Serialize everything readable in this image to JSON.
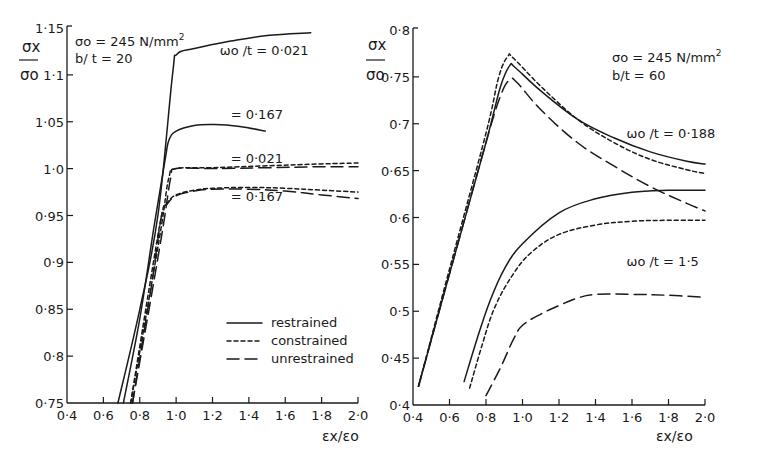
{
  "chart_data": [
    {
      "type": "line",
      "panel": "left",
      "title": "",
      "annotation": [
        "σo = 245 N/mm²",
        "b/ t = 20"
      ],
      "xlabel": "εx/εo",
      "ylabel": "σx/σo",
      "xlim": [
        0.4,
        2.0
      ],
      "ylim": [
        0.75,
        1.15
      ],
      "xticks": [
        "0·4",
        "0·6",
        "0·8",
        "1·0",
        "1·2",
        "1·4",
        "1·6",
        "1·8",
        "2·0"
      ],
      "yticks": [
        "0·75",
        "0·8",
        "0·85",
        "0·9",
        "0·95",
        "1·0",
        "1·05",
        "1·1",
        "1·15"
      ],
      "grid": false,
      "legend": {
        "position": "lower right",
        "entries": [
          {
            "style": "solid",
            "label": "restrained"
          },
          {
            "style": "short-dash",
            "label": "constrained"
          },
          {
            "style": "long-dash",
            "label": "unrestrained"
          }
        ]
      },
      "curve_labels": [
        {
          "text": "ωo /t = 0·021",
          "x": 1.24,
          "y": 1.121
        },
        {
          "text": "= 0·167",
          "x": 1.3,
          "y": 1.053
        },
        {
          "text": "= 0·021",
          "x": 1.3,
          "y": 1.006
        },
        {
          "text": "= 0·167",
          "x": 1.3,
          "y": 0.966
        }
      ],
      "series": [
        {
          "name": "restrained ωo/t=0.021",
          "style": "restrained",
          "x": [
            0.68,
            0.8,
            0.9,
            0.98,
            1.005,
            1.1,
            1.3,
            1.5,
            1.74
          ],
          "y": [
            0.75,
            0.85,
            0.95,
            1.1,
            1.122,
            1.128,
            1.136,
            1.142,
            1.145
          ]
        },
        {
          "name": "restrained ωo/t=0.167",
          "style": "restrained",
          "x": [
            0.71,
            0.8,
            0.88,
            0.94,
            0.96,
            1.0,
            1.1,
            1.21,
            1.35,
            1.49
          ],
          "y": [
            0.75,
            0.84,
            0.94,
            1.01,
            1.03,
            1.04,
            1.046,
            1.047,
            1.045,
            1.04
          ]
        },
        {
          "name": "constrained ωo/t=0.021",
          "style": "constrained",
          "x": [
            0.75,
            0.85,
            0.92,
            0.96,
            1.0,
            1.2,
            1.5,
            1.8,
            2.0
          ],
          "y": [
            0.75,
            0.86,
            0.94,
            0.99,
            1.0,
            1.001,
            1.003,
            1.005,
            1.006
          ]
        },
        {
          "name": "unrestrained ωo/t=0.021",
          "style": "unrestrained",
          "x": [
            0.76,
            0.86,
            0.93,
            0.97,
            1.0,
            1.2,
            1.5,
            1.8,
            2.0
          ],
          "y": [
            0.75,
            0.86,
            0.94,
            0.99,
            1.0,
            1.0,
            1.001,
            1.002,
            1.002
          ]
        },
        {
          "name": "constrained ωo/t=0.167",
          "style": "constrained",
          "x": [
            0.75,
            0.85,
            0.92,
            0.95,
            1.0,
            1.1,
            1.2,
            1.4,
            1.6,
            1.8,
            2.0
          ],
          "y": [
            0.75,
            0.87,
            0.95,
            0.963,
            0.972,
            0.977,
            0.979,
            0.98,
            0.979,
            0.977,
            0.975
          ]
        },
        {
          "name": "unrestrained ωo/t=0.167",
          "style": "unrestrained",
          "x": [
            0.76,
            0.86,
            0.92,
            0.95,
            1.0,
            1.1,
            1.2,
            1.4,
            1.6,
            1.8,
            2.0
          ],
          "y": [
            0.75,
            0.87,
            0.95,
            0.962,
            0.971,
            0.976,
            0.978,
            0.978,
            0.976,
            0.972,
            0.968
          ]
        }
      ]
    },
    {
      "type": "line",
      "panel": "right",
      "title": "",
      "annotation": [
        "σo = 245 N/mm²",
        "b/t = 60"
      ],
      "xlabel": "εx/εo",
      "ylabel": "σx/σo",
      "xlim": [
        0.4,
        2.0
      ],
      "ylim": [
        0.4,
        0.8
      ],
      "xticks": [
        "0·4",
        "0·6",
        "0·8",
        "1·0",
        "1·2",
        "1·4",
        "1·6",
        "1·8",
        "2·0"
      ],
      "yticks": [
        "0·4",
        "0·45",
        "0·5",
        "0·55",
        "0·6",
        "0·65",
        "0·7",
        "0·75",
        "0·8"
      ],
      "grid": false,
      "curve_labels": [
        {
          "text": "ωo /t = 0·188",
          "x": 1.57,
          "y": 0.685
        },
        {
          "text": "ωo /t = 1·5",
          "x": 1.57,
          "y": 0.548
        }
      ],
      "series": [
        {
          "name": "restrained ωo/t=0.188",
          "style": "restrained",
          "x": [
            0.43,
            0.6,
            0.8,
            0.88,
            0.93,
            0.96,
            1.1,
            1.3,
            1.5,
            1.7,
            1.9,
            2.0
          ],
          "y": [
            0.42,
            0.54,
            0.68,
            0.74,
            0.762,
            0.76,
            0.735,
            0.705,
            0.685,
            0.67,
            0.66,
            0.657
          ]
        },
        {
          "name": "constrained ωo/t=0.188",
          "style": "constrained",
          "x": [
            0.43,
            0.6,
            0.8,
            0.87,
            0.92,
            0.95,
            1.1,
            1.3,
            1.5,
            1.7,
            1.9,
            2.0
          ],
          "y": [
            0.42,
            0.545,
            0.69,
            0.75,
            0.772,
            0.77,
            0.74,
            0.705,
            0.68,
            0.662,
            0.651,
            0.647
          ]
        },
        {
          "name": "unrestrained ωo/t=0.188",
          "style": "unrestrained",
          "x": [
            0.43,
            0.6,
            0.8,
            0.88,
            0.93,
            0.97,
            1.1,
            1.3,
            1.5,
            1.7,
            1.9,
            2.0
          ],
          "y": [
            0.42,
            0.54,
            0.68,
            0.73,
            0.747,
            0.744,
            0.715,
            0.68,
            0.655,
            0.633,
            0.615,
            0.607
          ]
        },
        {
          "name": "restrained ωo/t=1.5",
          "style": "restrained",
          "x": [
            0.68,
            0.75,
            0.82,
            0.9,
            1.0,
            1.2,
            1.4,
            1.6,
            1.8,
            2.0
          ],
          "y": [
            0.425,
            0.47,
            0.51,
            0.545,
            0.572,
            0.605,
            0.62,
            0.627,
            0.629,
            0.629
          ]
        },
        {
          "name": "constrained ωo/t=1.5",
          "style": "constrained",
          "x": [
            0.71,
            0.78,
            0.85,
            0.95,
            1.05,
            1.2,
            1.4,
            1.6,
            1.8,
            2.0
          ],
          "y": [
            0.418,
            0.465,
            0.505,
            0.54,
            0.563,
            0.582,
            0.592,
            0.596,
            0.597,
            0.597
          ]
        },
        {
          "name": "unrestrained ωo/t=1.5",
          "style": "unrestrained",
          "x": [
            0.8,
            0.88,
            0.95,
            1.0,
            1.1,
            1.2,
            1.3,
            1.4,
            1.6,
            1.8,
            2.0
          ],
          "y": [
            0.41,
            0.44,
            0.47,
            0.485,
            0.497,
            0.506,
            0.514,
            0.518,
            0.518,
            0.517,
            0.515
          ]
        }
      ]
    }
  ],
  "legend": {
    "entries": [
      {
        "style": "restrained",
        "label": "restrained"
      },
      {
        "style": "constrained",
        "label": "constrained"
      },
      {
        "style": "unrestrained",
        "label": "unrestrained"
      }
    ]
  },
  "left": {
    "ylabel_num": "σx",
    "ylabel_den": "σo",
    "annot1": "σo = 245 N/mm",
    "annot1_sup": "2",
    "annot2": "b/ t = 20",
    "xlabel": "εx/εo"
  },
  "right": {
    "ylabel_num": "σx",
    "ylabel_den": "σo",
    "annot1": "σo = 245 N/mm",
    "annot1_sup": "2",
    "annot2": "b/t = 60",
    "xlabel": "εx/εo"
  }
}
